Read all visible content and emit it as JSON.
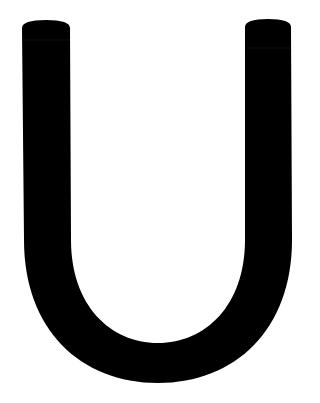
{
  "glyph": {
    "character": "U",
    "fill_color": "#000000",
    "background_color": "#ffffff"
  }
}
